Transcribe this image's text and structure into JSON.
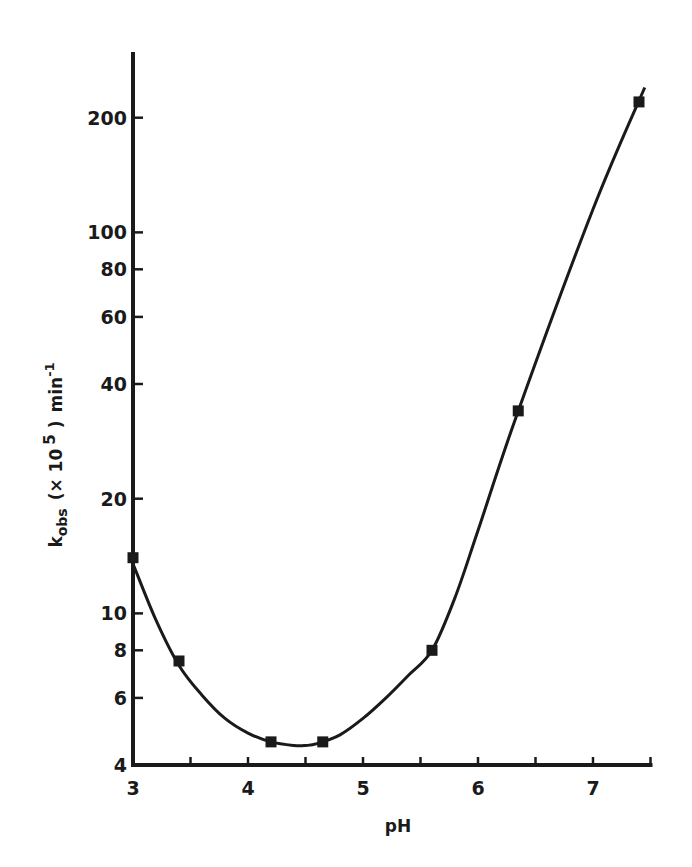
{
  "chart_data": {
    "type": "line",
    "title": "",
    "xlabel": "pH",
    "ylabel": "k_obs (×10^5) min^-1",
    "ylabel_parts": {
      "main": "k",
      "sub": "obs",
      "paren": "(× 10",
      "sup": "5",
      "close": ")",
      "unit": "min",
      "unit_sup": "-1"
    },
    "yscale": "log",
    "xlim": [
      3,
      7.5
    ],
    "ylim": [
      4,
      300
    ],
    "grid": false,
    "legend": null,
    "x_ticks": [
      3,
      3.5,
      4,
      4.5,
      5,
      5.5,
      6,
      6.5,
      7,
      7.5
    ],
    "x_tick_labels": [
      {
        "value": 3,
        "label": "3"
      },
      {
        "value": 4,
        "label": "4"
      },
      {
        "value": 5,
        "label": "5"
      },
      {
        "value": 6,
        "label": "6"
      },
      {
        "value": 7,
        "label": "7"
      }
    ],
    "y_tick_labels": [
      {
        "value": 4,
        "label": "4"
      },
      {
        "value": 6,
        "label": "6"
      },
      {
        "value": 8,
        "label": "8"
      },
      {
        "value": 10,
        "label": "10"
      },
      {
        "value": 20,
        "label": "20"
      },
      {
        "value": 40,
        "label": "40"
      },
      {
        "value": 60,
        "label": "60"
      },
      {
        "value": 80,
        "label": "80"
      },
      {
        "value": 100,
        "label": "100"
      },
      {
        "value": 200,
        "label": "200"
      }
    ],
    "series": [
      {
        "name": "observed",
        "marker": "square",
        "x": [
          3.0,
          3.4,
          4.2,
          4.65,
          5.6,
          6.35,
          7.4
        ],
        "y": [
          14,
          7.5,
          4.6,
          4.6,
          8,
          34,
          220
        ]
      },
      {
        "name": "fitted curve",
        "marker": "none",
        "x": [
          3.0,
          3.2,
          3.4,
          3.6,
          3.8,
          4.0,
          4.2,
          4.4,
          4.5,
          4.6,
          4.8,
          5.0,
          5.2,
          5.4,
          5.6,
          5.8,
          6.0,
          6.35,
          7.0,
          7.45
        ],
        "y": [
          13.5,
          9.6,
          7.3,
          6.1,
          5.3,
          4.85,
          4.6,
          4.5,
          4.5,
          4.55,
          4.8,
          5.3,
          6.0,
          6.9,
          8.0,
          11.0,
          16.5,
          34,
          115,
          240
        ]
      }
    ]
  }
}
